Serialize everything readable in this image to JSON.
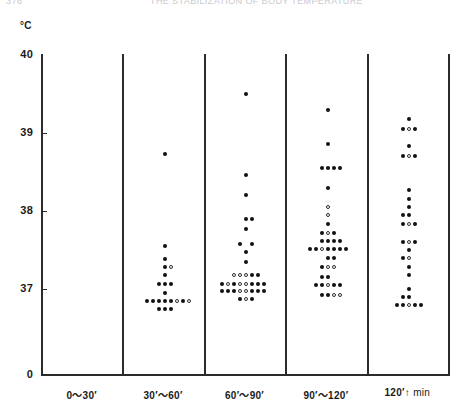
{
  "scan": {
    "page_number": "376",
    "running_head": "THE STABILIZATION OF BODY TEMPERATURE"
  },
  "axis": {
    "y_unit": "°C",
    "y_ticks": [
      {
        "label": "40",
        "value": 40
      },
      {
        "label": "39",
        "value": 39
      },
      {
        "label": "38",
        "value": 38
      },
      {
        "label": "37",
        "value": 37
      },
      {
        "label": "0",
        "value": 0
      }
    ],
    "x_categories": [
      {
        "label": "0～30′"
      },
      {
        "label": "30′～60′"
      },
      {
        "label": "60′～90′"
      },
      {
        "label": "90′～120′"
      },
      {
        "label": "120′↑"
      }
    ],
    "x_unit": "min"
  },
  "chart_data": {
    "type": "scatter",
    "title": "",
    "xlabel": "min",
    "ylabel": "°C",
    "ylim": [
      36.6,
      40
    ],
    "y_break_at_zero": true,
    "grid": false,
    "legend": "none",
    "marker_kinds": [
      "filled",
      "open"
    ],
    "categories": [
      "0～30′",
      "30′～60′",
      "60′～90′",
      "90′～120′",
      "120′↑"
    ],
    "series": [
      {
        "name": "0～30′",
        "n": 0,
        "points": []
      },
      {
        "name": "30′～60′",
        "n": 21,
        "points": [
          {
            "y": 38.73,
            "offset": 0,
            "kind": "filled"
          },
          {
            "y": 37.55,
            "offset": 0,
            "kind": "filled"
          },
          {
            "y": 37.38,
            "offset": 0,
            "kind": "filled"
          },
          {
            "y": 37.28,
            "offset": 0,
            "kind": "filled"
          },
          {
            "y": 37.28,
            "offset": 1,
            "kind": "open"
          },
          {
            "y": 37.18,
            "offset": 0,
            "kind": "filled"
          },
          {
            "y": 37.07,
            "offset": -1,
            "kind": "filled"
          },
          {
            "y": 37.07,
            "offset": 0,
            "kind": "filled"
          },
          {
            "y": 37.07,
            "offset": 1,
            "kind": "filled"
          },
          {
            "y": 36.95,
            "offset": 0,
            "kind": "filled"
          },
          {
            "y": 36.85,
            "offset": -3,
            "kind": "filled"
          },
          {
            "y": 36.85,
            "offset": -2,
            "kind": "filled"
          },
          {
            "y": 36.85,
            "offset": -1,
            "kind": "filled"
          },
          {
            "y": 36.85,
            "offset": 0,
            "kind": "filled"
          },
          {
            "y": 36.85,
            "offset": 1,
            "kind": "filled"
          },
          {
            "y": 36.85,
            "offset": 2,
            "kind": "open"
          },
          {
            "y": 36.85,
            "offset": 3,
            "kind": "filled"
          },
          {
            "y": 36.85,
            "offset": 4,
            "kind": "open"
          },
          {
            "y": 36.75,
            "offset": 0,
            "kind": "filled"
          },
          {
            "y": 36.75,
            "offset": 1,
            "kind": "filled"
          },
          {
            "y": 36.75,
            "offset": -1,
            "kind": "filled"
          }
        ]
      },
      {
        "name": "60′～90′",
        "n": 34,
        "points": [
          {
            "y": 39.5,
            "offset": 0,
            "kind": "filled"
          },
          {
            "y": 38.46,
            "offset": 0,
            "kind": "filled"
          },
          {
            "y": 38.2,
            "offset": 0,
            "kind": "filled"
          },
          {
            "y": 37.58,
            "offset": -1,
            "kind": "filled"
          },
          {
            "y": 37.58,
            "offset": 1,
            "kind": "filled"
          },
          {
            "y": 37.48,
            "offset": 0,
            "kind": "filled"
          },
          {
            "y": 37.35,
            "offset": 0,
            "kind": "filled"
          },
          {
            "y": 37.18,
            "offset": -2,
            "kind": "open"
          },
          {
            "y": 37.18,
            "offset": -1,
            "kind": "open"
          },
          {
            "y": 37.18,
            "offset": 0,
            "kind": "open"
          },
          {
            "y": 37.18,
            "offset": 1,
            "kind": "filled"
          },
          {
            "y": 37.18,
            "offset": 2,
            "kind": "filled"
          },
          {
            "y": 37.07,
            "offset": -4,
            "kind": "filled"
          },
          {
            "y": 37.07,
            "offset": -3,
            "kind": "open"
          },
          {
            "y": 37.07,
            "offset": -2,
            "kind": "filled"
          },
          {
            "y": 37.07,
            "offset": -1,
            "kind": "open"
          },
          {
            "y": 37.07,
            "offset": 0,
            "kind": "open"
          },
          {
            "y": 37.07,
            "offset": 1,
            "kind": "filled"
          },
          {
            "y": 37.07,
            "offset": 2,
            "kind": "filled"
          },
          {
            "y": 37.07,
            "offset": 3,
            "kind": "filled"
          },
          {
            "y": 36.97,
            "offset": -4,
            "kind": "filled"
          },
          {
            "y": 36.97,
            "offset": -3,
            "kind": "filled"
          },
          {
            "y": 36.97,
            "offset": -2,
            "kind": "filled"
          },
          {
            "y": 36.97,
            "offset": -1,
            "kind": "open"
          },
          {
            "y": 36.97,
            "offset": 0,
            "kind": "open"
          },
          {
            "y": 36.97,
            "offset": 1,
            "kind": "filled"
          },
          {
            "y": 36.97,
            "offset": 2,
            "kind": "filled"
          },
          {
            "y": 36.97,
            "offset": 3,
            "kind": "filled"
          },
          {
            "y": 36.87,
            "offset": -1,
            "kind": "filled"
          },
          {
            "y": 36.87,
            "offset": 0,
            "kind": "open"
          },
          {
            "y": 36.87,
            "offset": 1,
            "kind": "filled"
          },
          {
            "y": 37.9,
            "offset": 0,
            "kind": "filled"
          },
          {
            "y": 37.9,
            "offset": 1,
            "kind": "filled"
          },
          {
            "y": 37.77,
            "offset": 0,
            "kind": "filled"
          }
        ]
      },
      {
        "name": "90′～120′",
        "n": 40,
        "points": [
          {
            "y": 39.3,
            "offset": 0,
            "kind": "filled"
          },
          {
            "y": 38.86,
            "offset": 0,
            "kind": "filled"
          },
          {
            "y": 38.55,
            "offset": -1,
            "kind": "filled"
          },
          {
            "y": 38.55,
            "offset": 0,
            "kind": "filled"
          },
          {
            "y": 38.55,
            "offset": 1,
            "kind": "filled"
          },
          {
            "y": 38.29,
            "offset": 0,
            "kind": "filled"
          },
          {
            "y": 38.05,
            "offset": 0,
            "kind": "open"
          },
          {
            "y": 37.83,
            "offset": 0,
            "kind": "filled"
          },
          {
            "y": 37.72,
            "offset": -1,
            "kind": "filled"
          },
          {
            "y": 37.72,
            "offset": 0,
            "kind": "open"
          },
          {
            "y": 37.72,
            "offset": 1,
            "kind": "filled"
          },
          {
            "y": 37.62,
            "offset": -1,
            "kind": "filled"
          },
          {
            "y": 37.62,
            "offset": 0,
            "kind": "filled"
          },
          {
            "y": 37.62,
            "offset": 1,
            "kind": "filled"
          },
          {
            "y": 37.62,
            "offset": 2,
            "kind": "filled"
          },
          {
            "y": 37.51,
            "offset": -3,
            "kind": "filled"
          },
          {
            "y": 37.51,
            "offset": -2,
            "kind": "filled"
          },
          {
            "y": 37.51,
            "offset": -1,
            "kind": "open"
          },
          {
            "y": 37.51,
            "offset": 0,
            "kind": "filled"
          },
          {
            "y": 37.51,
            "offset": 1,
            "kind": "filled"
          },
          {
            "y": 37.51,
            "offset": 2,
            "kind": "filled"
          },
          {
            "y": 37.51,
            "offset": 3,
            "kind": "filled"
          },
          {
            "y": 37.4,
            "offset": 0,
            "kind": "filled"
          },
          {
            "y": 37.28,
            "offset": -1,
            "kind": "filled"
          },
          {
            "y": 37.28,
            "offset": 0,
            "kind": "open"
          },
          {
            "y": 37.28,
            "offset": 1,
            "kind": "open"
          },
          {
            "y": 37.16,
            "offset": -1,
            "kind": "filled"
          },
          {
            "y": 37.16,
            "offset": 0,
            "kind": "filled"
          },
          {
            "y": 37.05,
            "offset": -2,
            "kind": "filled"
          },
          {
            "y": 37.05,
            "offset": -1,
            "kind": "filled"
          },
          {
            "y": 37.05,
            "offset": 0,
            "kind": "open"
          },
          {
            "y": 37.05,
            "offset": 1,
            "kind": "filled"
          },
          {
            "y": 37.05,
            "offset": 2,
            "kind": "filled"
          },
          {
            "y": 36.92,
            "offset": -1,
            "kind": "filled"
          },
          {
            "y": 36.92,
            "offset": 0,
            "kind": "filled"
          },
          {
            "y": 36.92,
            "offset": 1,
            "kind": "open"
          },
          {
            "y": 37.95,
            "offset": 0,
            "kind": "open"
          },
          {
            "y": 38.55,
            "offset": 2,
            "kind": "filled"
          },
          {
            "y": 37.4,
            "offset": 1,
            "kind": "filled"
          },
          {
            "y": 36.92,
            "offset": 2,
            "kind": "open"
          }
        ]
      },
      {
        "name": "120′↑",
        "n": 32,
        "points": [
          {
            "y": 39.18,
            "offset": 0,
            "kind": "filled"
          },
          {
            "y": 39.05,
            "offset": -1,
            "kind": "filled"
          },
          {
            "y": 39.05,
            "offset": 0,
            "kind": "open"
          },
          {
            "y": 39.05,
            "offset": 1,
            "kind": "filled"
          },
          {
            "y": 38.83,
            "offset": 0,
            "kind": "filled"
          },
          {
            "y": 38.7,
            "offset": -1,
            "kind": "filled"
          },
          {
            "y": 38.7,
            "offset": 0,
            "kind": "open"
          },
          {
            "y": 38.7,
            "offset": 1,
            "kind": "filled"
          },
          {
            "y": 38.27,
            "offset": 0,
            "kind": "filled"
          },
          {
            "y": 38.15,
            "offset": 0,
            "kind": "filled"
          },
          {
            "y": 38.05,
            "offset": 0,
            "kind": "filled"
          },
          {
            "y": 37.95,
            "offset": -1,
            "kind": "filled"
          },
          {
            "y": 37.95,
            "offset": 0,
            "kind": "filled"
          },
          {
            "y": 37.83,
            "offset": -1,
            "kind": "filled"
          },
          {
            "y": 37.83,
            "offset": 0,
            "kind": "open"
          },
          {
            "y": 37.83,
            "offset": 1,
            "kind": "filled"
          },
          {
            "y": 37.6,
            "offset": -1,
            "kind": "filled"
          },
          {
            "y": 37.6,
            "offset": 0,
            "kind": "open"
          },
          {
            "y": 37.6,
            "offset": 1,
            "kind": "filled"
          },
          {
            "y": 37.5,
            "offset": 0,
            "kind": "filled"
          },
          {
            "y": 37.4,
            "offset": -1,
            "kind": "filled"
          },
          {
            "y": 37.4,
            "offset": 0,
            "kind": "open"
          },
          {
            "y": 37.28,
            "offset": 0,
            "kind": "filled"
          },
          {
            "y": 37.18,
            "offset": 0,
            "kind": "filled"
          },
          {
            "y": 37.0,
            "offset": 0,
            "kind": "filled"
          },
          {
            "y": 36.9,
            "offset": -1,
            "kind": "filled"
          },
          {
            "y": 36.9,
            "offset": 0,
            "kind": "filled"
          },
          {
            "y": 36.8,
            "offset": -2,
            "kind": "filled"
          },
          {
            "y": 36.8,
            "offset": -1,
            "kind": "filled"
          },
          {
            "y": 36.8,
            "offset": 0,
            "kind": "open"
          },
          {
            "y": 36.8,
            "offset": 1,
            "kind": "filled"
          },
          {
            "y": 36.8,
            "offset": 2,
            "kind": "filled"
          }
        ]
      }
    ]
  }
}
